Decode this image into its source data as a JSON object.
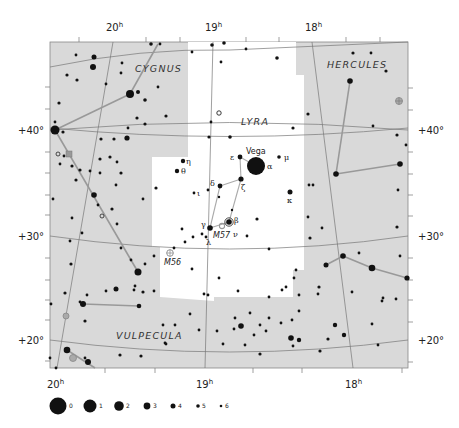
{
  "chart_title": "Lyra constellation star chart",
  "ra_labels": [
    {
      "text": "20",
      "sup": "h",
      "x": 38,
      "y": 28,
      "position": "top"
    },
    {
      "text": "19",
      "sup": "h",
      "x": 206,
      "y": 28,
      "position": "top"
    },
    {
      "text": "18",
      "sup": "h",
      "x": 77,
      "y": 28,
      "position": "top"
    },
    {
      "text": "20",
      "sup": "h",
      "x": 47,
      "y": 390,
      "position": "bottom"
    },
    {
      "text": "19",
      "sup": "h",
      "x": 197,
      "y": 390,
      "position": "bottom"
    },
    {
      "text": "18",
      "sup": "h",
      "x": 345,
      "y": 390,
      "position": "bottom"
    }
  ],
  "dec_labels": {
    "left": [
      "+40°",
      "+30°",
      "+20°"
    ],
    "right": [
      "+40°",
      "+30°",
      "+20°"
    ]
  },
  "constellations": {
    "cygnus": "CYGNUS",
    "hercules": "HERCULES",
    "lyra": "LYRA",
    "vulpecula": "VULPECULA"
  },
  "star_labels": {
    "vega": "Vega",
    "alpha": "α",
    "beta": "β",
    "gamma": "γ",
    "delta": "δ",
    "epsilon": "ε",
    "zeta": "ζ",
    "eta": "η",
    "theta": "θ",
    "iota": "ι",
    "kappa": "κ",
    "lambda": "λ",
    "mu": "μ",
    "nu": "ν"
  },
  "deep_sky": {
    "m57": "M57",
    "m56": "M56"
  },
  "magnitude_legend": {
    "items": [
      "0",
      "1",
      "2",
      "3",
      "4",
      "5",
      "6"
    ]
  },
  "colors": {
    "background_sky": "#d9d9d9",
    "lyra_area": "#ffffff",
    "star": "#111111",
    "grid_line": "#777777",
    "stick_line": "#999999"
  }
}
